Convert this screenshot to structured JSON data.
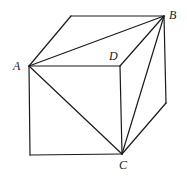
{
  "diagram": {
    "type": "cube-with-diagonals",
    "labels": {
      "A": "A",
      "B": "B",
      "C": "C",
      "D": "D"
    },
    "vertices": {
      "A": [
        29,
        66
      ],
      "B": [
        164,
        16
      ],
      "C": [
        122,
        154
      ],
      "D": [
        120,
        66
      ],
      "back_top_left": [
        71,
        16
      ],
      "front_bottom_left": [
        30,
        155
      ],
      "right_bottom": [
        166,
        103
      ]
    },
    "colors": {
      "stroke": "#1a1a1a",
      "background": "#ffffff"
    }
  }
}
